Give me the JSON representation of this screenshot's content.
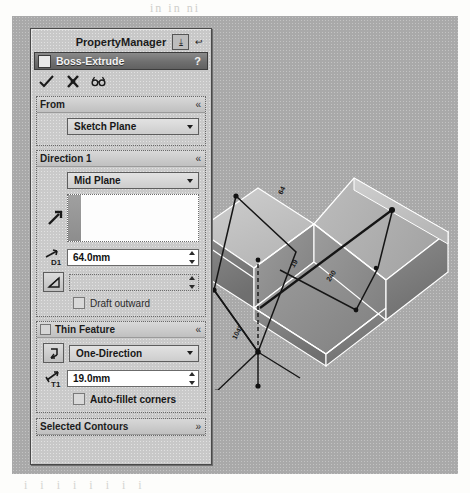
{
  "scan": {
    "ghost_top": "in in ni",
    "ghost_bottom": "i      i       i       i      i      i     i    i"
  },
  "property_manager": {
    "title": "PropertyManager",
    "header_icons": [
      {
        "name": "dock-panel-icon",
        "glyph": "⤓"
      },
      {
        "name": "pin-panel-icon",
        "glyph": "↩"
      }
    ],
    "feature": {
      "icon_name": "boss-extrude-icon",
      "name": "Boss-Extrude",
      "help_label": "?"
    },
    "confirm_buttons": [
      {
        "name": "ok-button",
        "label": "OK"
      },
      {
        "name": "cancel-button",
        "label": "Cancel"
      },
      {
        "name": "detailed-preview-button",
        "label": "Detailed preview"
      }
    ],
    "groups": [
      {
        "name": "from",
        "title": "From",
        "chevron": "«",
        "has_checkbox": false,
        "start_condition": {
          "label": "Sketch Plane",
          "options": [
            "Sketch Plane",
            "Surface/Face/Plane",
            "Vertex",
            "Offset"
          ]
        }
      },
      {
        "name": "direction-1",
        "title": "Direction 1",
        "chevron": "«",
        "has_checkbox": false,
        "end_condition": {
          "label": "Mid Plane",
          "options": [
            "Blind",
            "Through All",
            "Up To Next",
            "Up To Vertex",
            "Up To Surface",
            "Offset From Surface",
            "Up To Body",
            "Mid Plane"
          ]
        },
        "reverse_direction_button": "reverse-direction",
        "direction_reference": {
          "value": "",
          "placeholder": ""
        },
        "depth": {
          "icon_label": "D1",
          "value": "64.0mm"
        },
        "draft": {
          "icon_label": "draft-angle",
          "value": ""
        },
        "draft_outward": {
          "label": "Draft outward",
          "checked": false
        }
      },
      {
        "name": "thin-feature",
        "title": "Thin Feature",
        "chevron": "«",
        "has_checkbox": true,
        "checked": true,
        "thin_type": {
          "label": "One-Direction",
          "options": [
            "One-Direction",
            "Mid-Plane",
            "Two-Direction"
          ]
        },
        "reverse_thin_button": "reverse-thin-direction",
        "thickness": {
          "icon_label": "T1",
          "value": "19.0mm"
        },
        "auto_fillet": {
          "label": "Auto-fillet corners",
          "checked": false
        }
      },
      {
        "name": "selected-contours",
        "title": "Selected Contours",
        "chevron": "»",
        "collapsed": true,
        "has_checkbox": false
      }
    ]
  },
  "viewport": {
    "name": "graphics-viewport",
    "model_description": "Isometric shaded view of a thin-walled U-shaped extruded sheet part with sketch geometry and dimension annotations",
    "annotations": [
      {
        "name": "dimension-depth",
        "text": "64"
      },
      {
        "name": "dimension-length",
        "text": "240"
      },
      {
        "name": "dimension-angle",
        "text": "104°"
      },
      {
        "name": "dimension-thickness",
        "text": "19"
      }
    ],
    "colors": {
      "background": "#a9a9a9",
      "face_light": "#c9c9c9",
      "face_mid": "#a2a2a2",
      "face_dark": "#7f7f7f",
      "face_darker": "#6b6b6b",
      "edge": "#ffffff",
      "sketch": "#1a1a1a"
    }
  }
}
